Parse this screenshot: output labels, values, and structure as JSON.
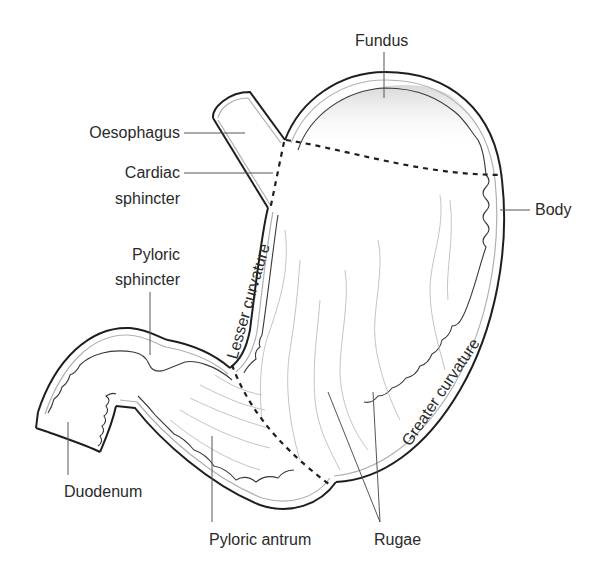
{
  "diagram": {
    "labels": {
      "fundus": "Fundus",
      "oesophagus": "Oesophagus",
      "cardiac_sphincter_1": "Cardiac",
      "cardiac_sphincter_2": "sphincter",
      "body": "Body",
      "pyloric_sphincter_1": "Pyloric",
      "pyloric_sphincter_2": "sphincter",
      "lesser_curvature": "Lesser curvature",
      "greater_curvature": "Greater curvature",
      "duodenum": "Duodenum",
      "pyloric_antrum": "Pyloric antrum",
      "rugae": "Rugae"
    },
    "colors": {
      "outline": "#1e1e1e",
      "inner_wall": "#b0b0b0",
      "rugae": "#c4c4c4",
      "leader": "#555555",
      "text": "#2a2a2a"
    }
  }
}
